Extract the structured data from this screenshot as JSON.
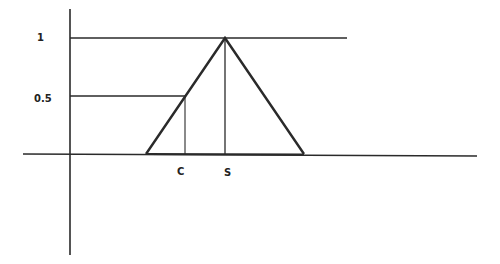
{
  "diagram": {
    "type": "triangular-membership-function",
    "colors": {
      "background": "#ffffff",
      "stroke": "#2a2a2a",
      "text": "#222222"
    },
    "y_axis": {
      "tick_labels": [
        {
          "label": "1",
          "value": 1
        },
        {
          "label": "0.5",
          "value": 0.5
        }
      ]
    },
    "x_axis": {
      "point_labels": [
        {
          "label": "C"
        },
        {
          "label": "S"
        }
      ]
    },
    "labels": {
      "y_one": "1",
      "y_half": "0.5",
      "x_c": "C",
      "x_s": "S"
    }
  }
}
